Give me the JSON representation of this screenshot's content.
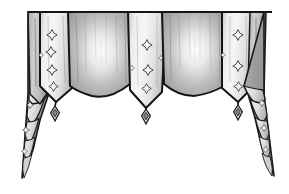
{
  "image": {
    "title": "Window Valance Illustration",
    "subject": "swag-valance-with-cascades",
    "medium": "pencil-and-ink-line-drawing",
    "width": 289,
    "height": 194,
    "background_color": "#ffffff"
  },
  "palette": {
    "ink": "#111111",
    "outline": "#1a1a1a",
    "panel_light_top": "#f2f2f2",
    "panel_light_mid": "#e2e2e2",
    "panel_light_edge": "#b9b9b9",
    "swag_dark_edge": "#8f8f8f",
    "swag_dark_mid": "#a8a8a8",
    "swag_highlight": "#fbfbfb",
    "cascade_dark": "#9a9a9a",
    "cascade_light": "#e6e6e6",
    "motif_ink": "#3a3a3a",
    "pleat_line": "#6e6e6e"
  },
  "geometry": {
    "top_rod_y": 12,
    "top_left_x": 28,
    "top_right_x": 272,
    "swag_bottom_y": 92,
    "cascade_tip_left": {
      "x": 22,
      "y": 178
    },
    "cascade_tip_right": {
      "x": 274,
      "y": 176
    }
  },
  "panels": [
    {
      "id": "cascade-left",
      "label": "Left Cascade",
      "type": "cascade",
      "tone": "mixed",
      "fold_count": 5,
      "motif_count": 3
    },
    {
      "id": "panel-light-1",
      "label": "Left Light Panel",
      "type": "pointed-panel",
      "tone": "light",
      "motif_count": 4,
      "motif_shape": "four-point-star"
    },
    {
      "id": "swag-dark-1",
      "label": "Left Dark Swag",
      "type": "swag",
      "tone": "dark",
      "pleat_count": 7,
      "has_highlight": true
    },
    {
      "id": "panel-light-2",
      "label": "Center Light Panel",
      "type": "pointed-panel",
      "tone": "light",
      "motif_count": 3,
      "motif_shape": "four-point-star"
    },
    {
      "id": "swag-dark-2",
      "label": "Right Dark Swag",
      "type": "swag",
      "tone": "dark",
      "pleat_count": 7,
      "has_highlight": true
    },
    {
      "id": "panel-light-3",
      "label": "Right Light Panel",
      "type": "pointed-panel",
      "tone": "light",
      "motif_count": 4,
      "motif_shape": "four-point-star"
    },
    {
      "id": "cascade-right",
      "label": "Right Cascade",
      "type": "cascade",
      "tone": "mixed",
      "fold_count": 5,
      "motif_count": 3
    }
  ],
  "tassels": [
    {
      "id": "tassel-left",
      "label": "Left Tassel",
      "x": 55,
      "y": 113,
      "shape": "diamond"
    },
    {
      "id": "tassel-center",
      "label": "Center Tassel",
      "x": 146,
      "y": 116,
      "shape": "diamond"
    },
    {
      "id": "tassel-right",
      "label": "Right Tassel",
      "x": 238,
      "y": 112,
      "shape": "diamond"
    }
  ],
  "motifs": {
    "shape": "four-point-star",
    "description": "small four-pointed star / diamond sprig",
    "positions_light_1": [
      {
        "x": 52,
        "y": 35,
        "r": 5.5
      },
      {
        "x": 51,
        "y": 52,
        "r": 5.5
      },
      {
        "x": 52,
        "y": 70,
        "r": 5.5
      },
      {
        "x": 53,
        "y": 87,
        "r": 5.0
      }
    ],
    "positions_light_2": [
      {
        "x": 147,
        "y": 45,
        "r": 5.5
      },
      {
        "x": 148,
        "y": 70,
        "r": 5.5
      },
      {
        "x": 147,
        "y": 89,
        "r": 5.0
      },
      {
        "x": 132,
        "y": 68,
        "r": 3.0
      },
      {
        "x": 161,
        "y": 58,
        "r": 3.0
      }
    ],
    "positions_light_3": [
      {
        "x": 238,
        "y": 35,
        "r": 5.5
      },
      {
        "x": 238,
        "y": 66,
        "r": 5.5
      },
      {
        "x": 239,
        "y": 87,
        "r": 5.0
      },
      {
        "x": 223,
        "y": 55,
        "r": 3.0
      },
      {
        "x": 254,
        "y": 70,
        "r": 3.0
      }
    ],
    "positions_cascade_left": [
      {
        "x": 30,
        "y": 105,
        "r": 3.0
      },
      {
        "x": 26,
        "y": 130,
        "r": 3.0
      },
      {
        "x": 24,
        "y": 152,
        "r": 2.5
      }
    ],
    "positions_cascade_right": [
      {
        "x": 262,
        "y": 103,
        "r": 3.0
      },
      {
        "x": 264,
        "y": 128,
        "r": 3.0
      },
      {
        "x": 266,
        "y": 150,
        "r": 2.5
      }
    ]
  }
}
